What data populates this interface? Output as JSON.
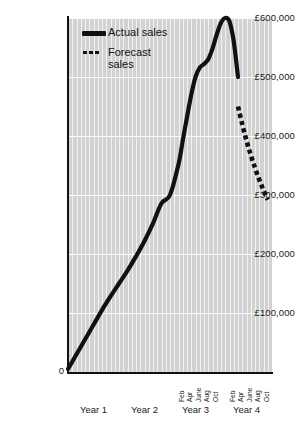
{
  "chart_data": {
    "type": "line",
    "title": "",
    "xlabel": "",
    "ylabel": "",
    "ylim": [
      0,
      600000
    ],
    "ytick_labels": [
      "£600,000",
      "£500,000",
      "£400,000",
      "£300,000",
      "£200,000",
      "£100,000",
      "0"
    ],
    "ytick_values": [
      600000,
      500000,
      400000,
      300000,
      200000,
      100000,
      0
    ],
    "grid": true,
    "legend_position": "top-left",
    "currency": "GBP",
    "x_groups": [
      "Year 1",
      "Year 2",
      "Year 3",
      "Year 4"
    ],
    "x_month_ticks": [
      "Feb",
      "Apr",
      "June",
      "Aug",
      "Oct"
    ],
    "month_tick_groups": [
      "Year 3",
      "Year 4"
    ],
    "series": [
      {
        "name": "Actual sales",
        "style": "solid",
        "color": "#111111",
        "x": [
          0,
          2,
          4,
          6,
          8,
          10,
          12,
          14,
          16,
          18,
          20,
          22,
          24,
          26,
          27,
          28,
          29,
          30,
          31,
          32,
          33,
          34,
          35,
          36,
          37,
          38,
          39,
          40
        ],
        "values": [
          5000,
          30000,
          55000,
          80000,
          105000,
          128000,
          150000,
          172000,
          196000,
          222000,
          252000,
          286000,
          300000,
          352000,
          392000,
          432000,
          470000,
          500000,
          516000,
          522000,
          530000,
          548000,
          572000,
          592000,
          600000,
          594000,
          560000,
          500000
        ]
      },
      {
        "name": "Forecast sales",
        "style": "dotted",
        "color": "#111111",
        "x": [
          40,
          41,
          42,
          43,
          44,
          45,
          46,
          47
        ],
        "values": [
          450000,
          420000,
          392000,
          368000,
          346000,
          326000,
          308000,
          292000
        ]
      }
    ]
  },
  "legend": {
    "items": [
      {
        "label": "Actual sales",
        "marker": "solid-line-key"
      },
      {
        "label": "Forecast\nsales",
        "label_line1": "Forecast",
        "label_line2": "sales",
        "marker": "dotted-line-key"
      }
    ]
  },
  "axes": {
    "y_labels": [
      "£600,000",
      "£500,000",
      "£400,000",
      "£300,000",
      "£200,000",
      "£100,000"
    ],
    "origin_label": "0",
    "year_labels": [
      "Year 1",
      "Year 2",
      "Year 3",
      "Year 4"
    ],
    "month_labels": [
      "Feb",
      "Apr",
      "June",
      "Aug",
      "Oct"
    ]
  },
  "colors": {
    "plot_background": "#d2d2d2",
    "gridline": "#f4f4f4",
    "series_line": "#111111",
    "axis": "#111111",
    "page_background": "#ffffff"
  }
}
